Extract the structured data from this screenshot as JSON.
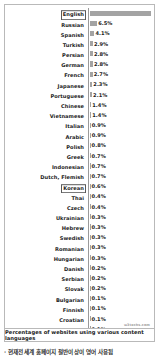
{
  "chart_data": {
    "type": "bar",
    "orientation": "horizontal",
    "title": "",
    "caption": "Percentages of websites using various content languages",
    "watermark": "w3techs.com",
    "xlabel": "",
    "ylabel": "",
    "xlim": [
      0,
      53.6
    ],
    "grid": false,
    "legend": "none",
    "value_suffix": "%",
    "highlighted": [
      "English",
      "Korean"
    ],
    "categories": [
      "English",
      "Russian",
      "Spanish",
      "Turkish",
      "Persian",
      "German",
      "French",
      "Japanese",
      "Portuguese",
      "Chinese",
      "Vietnamese",
      "Italian",
      "Arabic",
      "Polish",
      "Greek",
      "Indonesian",
      "Dutch, Flemish",
      "Korean",
      "Thai",
      "Czech",
      "Ukrainian",
      "Hebrew",
      "Swedish",
      "Romanian",
      "Hungarian",
      "Danish",
      "Serbian",
      "Slovak",
      "Bulgarian",
      "Finnish",
      "Croatian",
      "Lithuanian",
      "Norwegian Bokmål",
      "Hindi",
      "Norwegian",
      "Slovenian",
      "Latvian",
      "Estonian"
    ],
    "values": [
      53.6,
      6.5,
      4.1,
      2.9,
      2.8,
      2.8,
      2.7,
      2.3,
      2.1,
      1.4,
      1.4,
      0.9,
      0.9,
      0.8,
      0.7,
      0.7,
      0.7,
      0.6,
      0.4,
      0.4,
      0.3,
      0.3,
      0.3,
      0.3,
      0.3,
      0.2,
      0.2,
      0.2,
      0.1,
      0.1,
      0.1,
      0.1,
      0.1,
      0.1,
      0.1,
      0.1,
      0.1,
      0.1
    ],
    "value_labels": [
      "53.6%",
      "6.5%",
      "4.1%",
      "2.9%",
      "2.8%",
      "2.8%",
      "2.7%",
      "2.3%",
      "2.1%",
      "1.4%",
      "1.4%",
      "0.9%",
      "0.9%",
      "0.8%",
      "0.7%",
      "0.7%",
      "0.7%",
      "0.6%",
      "0.4%",
      "0.4%",
      "0.3%",
      "0.3%",
      "0.3%",
      "0.3%",
      "0.3%",
      "0.2%",
      "0.2%",
      "0.2%",
      "0.1%",
      "0.1%",
      "0.1%",
      "0.1%",
      "0.1%",
      "0.1%",
      "0.1%",
      "0.1%",
      "0.1%",
      "0.1%"
    ],
    "bar_color": "#a3a3a3",
    "frame_color": "#b9b9b9"
  },
  "below_text": "· 현재전세계 홈페이지   절반이상이 영어 사용됨"
}
